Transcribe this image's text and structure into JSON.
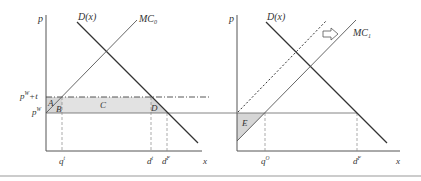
{
  "colors": {
    "axis": "#555555",
    "curve": "#333333",
    "shade": "#d6d6d6",
    "guide": "#888888",
    "bottom_rule": "#bbbbbb"
  },
  "left_panel": {
    "y_axis_label": "p",
    "x_axis_label": "x",
    "demand_label": "D(x)",
    "supply_label": "MC",
    "supply_subscript": "0",
    "price_tariff_label": "p",
    "price_tariff_sup": "W",
    "price_tariff_suffix": "+t",
    "price_world_label": "p",
    "price_world_sup": "W",
    "areas": [
      "A",
      "B",
      "C",
      "D"
    ],
    "x_ticks": [
      {
        "base": "q",
        "sup": "t"
      },
      {
        "base": "d",
        "sup": "t"
      },
      {
        "base": "d",
        "sup": "F"
      }
    ]
  },
  "right_panel": {
    "y_axis_label": "p",
    "x_axis_label": "x",
    "demand_label": "D(x)",
    "supply_label": "MC",
    "supply_subscript": "1",
    "shift_arrow": "right-arrow-icon",
    "areas": [
      "E"
    ],
    "x_ticks": [
      {
        "base": "q",
        "sup": "O"
      },
      {
        "base": "d",
        "sup": "F"
      }
    ]
  }
}
